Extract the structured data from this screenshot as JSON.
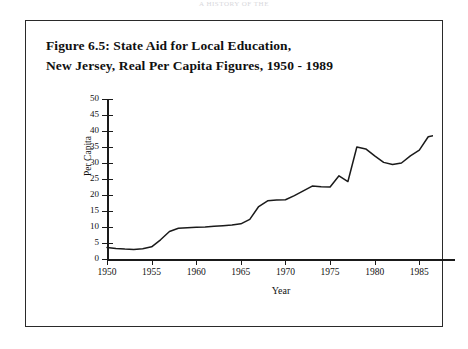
{
  "running_head": "A HISTORY OF THE",
  "figure": {
    "title_line1": "Figure 6.5: State Aid for Local Education,",
    "title_line2": "New Jersey, Real Per Capita Figures, 1950 - 1989"
  },
  "chart_data": {
    "type": "line",
    "title": "Figure 6.5: State Aid for Local Education, New Jersey, Real Per Capita Figures, 1950 - 1989",
    "xlabel": "Year",
    "ylabel": "Per Capita",
    "xlim": [
      1950,
      1989
    ],
    "ylim": [
      0,
      50
    ],
    "y_ticks": [
      0,
      5,
      10,
      15,
      20,
      25,
      30,
      35,
      40,
      45,
      50
    ],
    "x_ticks": [
      1950,
      1955,
      1960,
      1965,
      1970,
      1975,
      1980,
      1985
    ],
    "x_tick_labels": [
      "1950",
      "1955",
      "1960",
      "1965",
      "1970",
      "1975",
      "1980",
      "1985"
    ],
    "grid": false,
    "legend": null,
    "line_color": "#1a1a1a",
    "series": [
      {
        "name": "Real per capita state aid",
        "x": [
          1950,
          1951,
          1952,
          1953,
          1954,
          1955,
          1956,
          1957,
          1958,
          1959,
          1960,
          1961,
          1962,
          1963,
          1964,
          1965,
          1966,
          1967,
          1968,
          1969,
          1970,
          1971,
          1972,
          1973,
          1974,
          1975,
          1976,
          1977,
          1978,
          1979,
          1980,
          1981,
          1982,
          1983,
          1984,
          1985,
          1986,
          1987,
          1988
        ],
        "values": [
          3.6,
          3.3,
          3.1,
          3.0,
          3.2,
          3.8,
          6.0,
          8.6,
          9.6,
          9.8,
          9.9,
          10.0,
          10.2,
          10.4,
          10.6,
          11.0,
          12.4,
          16.4,
          18.2,
          18.4,
          18.5,
          19.8,
          21.3,
          22.8,
          22.6,
          22.5,
          26.0,
          24.2,
          35.0,
          34.4,
          32.2,
          30.2,
          29.5,
          30.0,
          32.2,
          34.0,
          38.2,
          38.8,
          44.2
        ]
      }
    ]
  }
}
